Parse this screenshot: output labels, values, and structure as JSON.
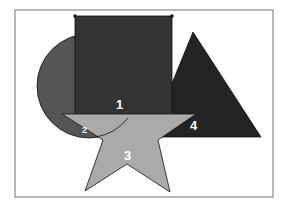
{
  "diagram": {
    "frame": {
      "x": 15,
      "y": 10,
      "width": 258,
      "height": 187,
      "stroke": "#888888"
    },
    "shapes": [
      {
        "id": "circle",
        "label": "2",
        "type": "circle",
        "cx": 88,
        "cy": 85,
        "r": 52,
        "fill": "#555555"
      },
      {
        "id": "triangle",
        "label": "4",
        "type": "triangle",
        "fill": "#232323"
      },
      {
        "id": "square",
        "label": "1",
        "type": "square",
        "fill": "#333333"
      },
      {
        "id": "star",
        "label": "3",
        "type": "star",
        "fill": "#aaaaaa"
      }
    ],
    "labels": {
      "square": "1",
      "circle": "2",
      "star": "3",
      "triangle": "4"
    }
  }
}
